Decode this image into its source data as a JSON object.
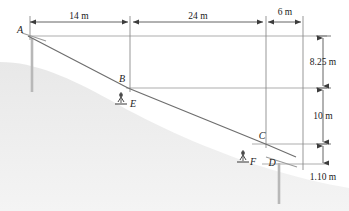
{
  "figure": {
    "colors": {
      "line": "#5a5a5a",
      "cable": "#6e6e6e",
      "dimension": "#3c3c3c",
      "terrain": "#ededed",
      "tower": "#b8b8b8",
      "text": "#1a1a1a",
      "background": "#ffffff"
    },
    "points": [
      {
        "id": "A",
        "label": "A",
        "x": 30,
        "y": 34
      },
      {
        "id": "B",
        "label": "B",
        "x": 128,
        "y": 86
      },
      {
        "id": "C",
        "label": "C",
        "x": 268,
        "y": 142
      },
      {
        "id": "D",
        "label": "D",
        "x": 278,
        "y": 163
      },
      {
        "id": "E",
        "label": "E",
        "x": 131,
        "y": 105
      },
      {
        "id": "F",
        "label": "F",
        "x": 252,
        "y": 162
      }
    ],
    "horizontal_dimensions": [
      {
        "id": "span-a-b",
        "label": "14 m",
        "value": 14,
        "unit": "m",
        "x1": 30,
        "x2": 128,
        "y": 22,
        "text_x": 79,
        "text_y": 19
      },
      {
        "id": "span-b-c",
        "label": "24 m",
        "value": 24,
        "unit": "m",
        "x1": 133,
        "x2": 263,
        "y": 22,
        "text_x": 198,
        "text_y": 19
      },
      {
        "id": "span-c-d",
        "label": "6 m",
        "value": 6,
        "unit": "m",
        "x1": 268,
        "x2": 303,
        "y": 22,
        "text_x": 285,
        "text_y": 19
      }
    ],
    "vertical_dimensions": [
      {
        "id": "drop-a-b",
        "label": "8.25 m",
        "value": 8.25,
        "unit": "m",
        "x": 323,
        "y1": 35,
        "y2": 87,
        "text_x": 330,
        "text_y": 63
      },
      {
        "id": "drop-b-c",
        "label": "10 m",
        "value": 10,
        "unit": "m",
        "x": 323,
        "y1": 87,
        "y2": 143,
        "text_x": 330,
        "text_y": 117
      },
      {
        "id": "drop-c-d",
        "label": "1.10 m",
        "value": 1.1,
        "unit": "m",
        "x": 323,
        "y1": 143,
        "y2": 164,
        "text_x": 330,
        "text_y": 180
      }
    ],
    "towers": [
      {
        "id": "tower-a",
        "x": 32,
        "y_top": 38,
        "y_bottom": 92
      },
      {
        "id": "tower-d",
        "x": 279,
        "y_top": 163,
        "y_bottom": 204
      }
    ],
    "cable_path": "M 28 36 L 128 88 L 268 145 L 296 157",
    "reference_lines": [
      {
        "id": "ref-line-a",
        "x1": 28,
        "y1": 36,
        "x2": 327,
        "y2": 36
      },
      {
        "id": "ref-line-b",
        "x1": 126,
        "y1": 88,
        "x2": 327,
        "y2": 88
      },
      {
        "id": "ref-line-c",
        "x1": 252,
        "y1": 144,
        "x2": 327,
        "y2": 144
      },
      {
        "id": "ref-line-d",
        "x1": 262,
        "y1": 164,
        "x2": 327,
        "y2": 164
      }
    ],
    "extension_lines": [
      {
        "id": "ext-a",
        "x": 30,
        "y1": 16,
        "y2": 40
      },
      {
        "id": "ext-b",
        "x": 130,
        "y1": 16,
        "y2": 92
      },
      {
        "id": "ext-c",
        "x": 266,
        "y1": 16,
        "y2": 148
      },
      {
        "id": "ext-d",
        "x": 303,
        "y1": 16,
        "y2": 170
      }
    ],
    "terrain_label": "hillside-slope"
  }
}
